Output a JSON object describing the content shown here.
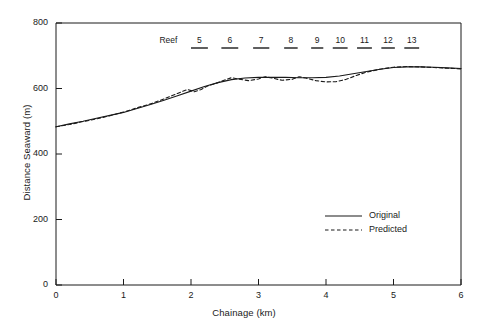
{
  "chart_data": {
    "type": "line",
    "title": "",
    "xlabel": "Chainage (km)",
    "ylabel": "Distance Seaward (m)",
    "xlim": [
      0,
      6
    ],
    "ylim": [
      0,
      800
    ],
    "xticks": [
      0,
      1,
      2,
      3,
      4,
      5,
      6
    ],
    "yticks": [
      0,
      200,
      400,
      600,
      800
    ],
    "grid": false,
    "legend_position": "lower right",
    "series": [
      {
        "name": "Original",
        "style": "solid",
        "color": "#1a1a1a",
        "x": [
          0.0,
          0.2,
          0.4,
          0.6,
          0.8,
          1.0,
          1.2,
          1.4,
          1.6,
          1.8,
          2.0,
          2.2,
          2.4,
          2.6,
          2.8,
          3.0,
          3.2,
          3.4,
          3.6,
          3.8,
          4.0,
          4.2,
          4.4,
          4.6,
          4.8,
          5.0,
          5.2,
          5.4,
          5.6,
          5.8,
          6.0
        ],
        "y": [
          483,
          492,
          500,
          509,
          518,
          527,
          539,
          551,
          564,
          578,
          592,
          606,
          618,
          627,
          632,
          634,
          634,
          634,
          633,
          633,
          634,
          638,
          645,
          652,
          659,
          664,
          666,
          666,
          665,
          663,
          661
        ]
      },
      {
        "name": "Predicted",
        "style": "dashed",
        "color": "#1a1a1a",
        "x": [
          0.0,
          0.2,
          0.4,
          0.6,
          0.8,
          1.0,
          1.2,
          1.4,
          1.6,
          1.8,
          1.95,
          2.05,
          2.15,
          2.25,
          2.4,
          2.5,
          2.6,
          2.7,
          2.85,
          3.0,
          3.1,
          3.2,
          3.35,
          3.5,
          3.6,
          3.7,
          3.85,
          4.0,
          4.15,
          4.3,
          4.45,
          4.6,
          4.8,
          5.0,
          5.2,
          5.4,
          5.6,
          5.8,
          6.0
        ],
        "y": [
          483,
          490,
          499,
          507,
          517,
          528,
          541,
          553,
          568,
          585,
          597,
          590,
          597,
          608,
          618,
          626,
          633,
          629,
          624,
          629,
          636,
          632,
          625,
          628,
          636,
          632,
          624,
          620,
          621,
          628,
          640,
          650,
          659,
          665,
          667,
          666,
          664,
          662,
          660
        ]
      }
    ],
    "annotations": {
      "prefix_label": "Reef",
      "reefs": [
        {
          "label": "5",
          "x_start": 2.0,
          "x_end": 2.25
        },
        {
          "label": "6",
          "x_start": 2.45,
          "x_end": 2.7
        },
        {
          "label": "7",
          "x_start": 2.92,
          "x_end": 3.16
        },
        {
          "label": "8",
          "x_start": 3.38,
          "x_end": 3.58
        },
        {
          "label": "9",
          "x_start": 3.78,
          "x_end": 3.96
        },
        {
          "label": "10",
          "x_start": 4.1,
          "x_end": 4.32
        },
        {
          "label": "11",
          "x_start": 4.46,
          "x_end": 4.68
        },
        {
          "label": "12",
          "x_start": 4.82,
          "x_end": 5.02
        },
        {
          "label": "13",
          "x_start": 5.16,
          "x_end": 5.38
        }
      ]
    }
  },
  "legend": {
    "items": [
      {
        "label": "Original",
        "style": "solid"
      },
      {
        "label": "Predicted",
        "style": "dashed"
      }
    ]
  }
}
